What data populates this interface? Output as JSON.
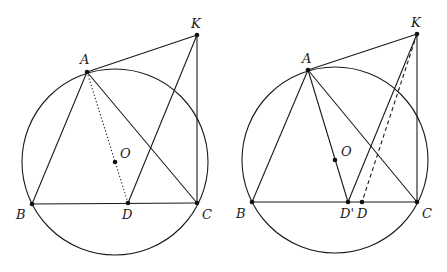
{
  "figures": [
    {
      "id": "left",
      "circle": {
        "cx": 115,
        "cy": 162,
        "r": 93
      },
      "points": {
        "A": {
          "x": 87,
          "y": 72,
          "label": "A",
          "lx": 80,
          "ly": 64
        },
        "B": {
          "x": 32,
          "y": 204,
          "label": "B",
          "lx": 16,
          "ly": 219
        },
        "C": {
          "x": 197,
          "y": 203,
          "label": "C",
          "lx": 202,
          "ly": 219
        },
        "D": {
          "x": 128,
          "y": 203,
          "label": "D",
          "lx": 122,
          "ly": 219
        },
        "K": {
          "x": 197,
          "y": 35,
          "label": "K",
          "lx": 191,
          "ly": 28
        },
        "O": {
          "x": 115,
          "y": 162,
          "label": "O",
          "lx": 120,
          "ly": 158
        }
      },
      "segments": [
        [
          "A",
          "B",
          "solid"
        ],
        [
          "B",
          "C",
          "solid"
        ],
        [
          "A",
          "C",
          "solid"
        ],
        [
          "A",
          "K",
          "solid"
        ],
        [
          "K",
          "C",
          "solid"
        ],
        [
          "K",
          "D",
          "solid"
        ],
        [
          "A",
          "D",
          "dotted"
        ]
      ]
    },
    {
      "id": "right",
      "circle": {
        "cx": 335,
        "cy": 160,
        "r": 93
      },
      "points": {
        "A": {
          "x": 308,
          "y": 70,
          "label": "A",
          "lx": 302,
          "ly": 63
        },
        "B": {
          "x": 252,
          "y": 202,
          "label": "B",
          "lx": 236,
          "ly": 218
        },
        "C": {
          "x": 417,
          "y": 202,
          "label": "C",
          "lx": 422,
          "ly": 218
        },
        "D'": {
          "x": 348,
          "y": 202,
          "label": "D'",
          "lx": 340,
          "ly": 218
        },
        "D": {
          "x": 362,
          "y": 202,
          "label": "D",
          "lx": 357,
          "ly": 218
        },
        "K": {
          "x": 417,
          "y": 34,
          "label": "K",
          "lx": 411,
          "ly": 27
        },
        "O": {
          "x": 335,
          "y": 160,
          "label": "O",
          "lx": 341,
          "ly": 156
        }
      },
      "segments": [
        [
          "A",
          "B",
          "solid"
        ],
        [
          "B",
          "C",
          "solid"
        ],
        [
          "A",
          "C",
          "solid"
        ],
        [
          "A",
          "K",
          "solid"
        ],
        [
          "K",
          "C",
          "solid"
        ],
        [
          "K",
          "D'",
          "solid"
        ],
        [
          "A",
          "D'",
          "solid"
        ],
        [
          "K",
          "D",
          "dashed"
        ]
      ]
    }
  ]
}
